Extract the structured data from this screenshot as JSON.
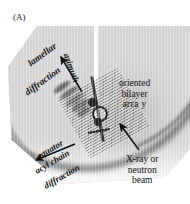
{
  "figure": {
    "panel_label": "(A)",
    "type": "x-ray-diffraction-schematic",
    "background_color": "#ffffff",
    "plate_color": "#d2d2d2",
    "ink_color": "#111111"
  },
  "labels": {
    "lamellar_line1": "lamellar",
    "lamellar_line2": "diffraction",
    "azimuth": "azimuth",
    "equator": "equator",
    "acyl_chain": "acyl chain",
    "acyl_diffraction": "diffraction",
    "array_line1": "oriented",
    "array_line2": "bilayer",
    "array_line3": "arra y",
    "beam_line1": "X-ray or",
    "beam_line2": "neutron",
    "beam_line3": "beam"
  },
  "annotations": {
    "azimuth_arrow": "arrow-up-left",
    "equator_arrow": "arrow-down-left",
    "beam_arrow": "arrow-up-left"
  },
  "features": {
    "beamstop": "white-vertical-stripe",
    "sample": "oriented-bilayer-array-slab",
    "lamellar_reflections": "stacked-arcs",
    "equatorial_arc": "wide-acyl-chain-band",
    "meridional_arc": "lamellar-band"
  }
}
